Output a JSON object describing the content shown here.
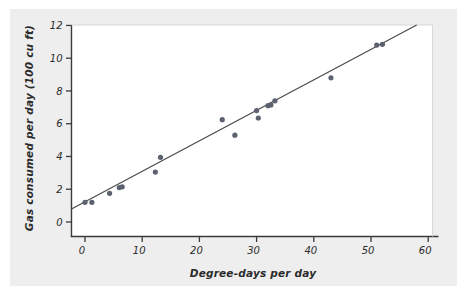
{
  "chart_data": {
    "type": "scatter",
    "title": "",
    "xlabel": "Degree-days per day",
    "ylabel": "Gas consumed per day (100 cu ft)",
    "xlim": [
      -3,
      63
    ],
    "ylim": [
      -0.55,
      12.6
    ],
    "xticks": [
      0,
      10,
      20,
      30,
      40,
      50,
      60
    ],
    "yticks": [
      0,
      2,
      4,
      6,
      8,
      10,
      12
    ],
    "xtick_labels": [
      "0",
      "10",
      "20",
      "30",
      "40",
      "50",
      "60"
    ],
    "ytick_labels": [
      "0",
      "2",
      "4",
      "6",
      "8",
      "10",
      "12"
    ],
    "grid": false,
    "legend": null,
    "marker_color": "#5c6170",
    "line_color": "#4a4a4a",
    "panel_color": "#eeeeee",
    "plot_area_color": "#ffffff",
    "points": [
      {
        "x": 0.0,
        "y": 1.2
      },
      {
        "x": 1.2,
        "y": 1.2
      },
      {
        "x": 4.3,
        "y": 1.75
      },
      {
        "x": 6.0,
        "y": 2.1
      },
      {
        "x": 6.5,
        "y": 2.15
      },
      {
        "x": 12.3,
        "y": 3.05
      },
      {
        "x": 13.2,
        "y": 3.95
      },
      {
        "x": 24.0,
        "y": 6.25
      },
      {
        "x": 26.2,
        "y": 5.3
      },
      {
        "x": 30.0,
        "y": 6.8
      },
      {
        "x": 30.3,
        "y": 6.35
      },
      {
        "x": 32.0,
        "y": 7.1
      },
      {
        "x": 32.5,
        "y": 7.15
      },
      {
        "x": 33.2,
        "y": 7.4
      },
      {
        "x": 43.0,
        "y": 8.8
      },
      {
        "x": 51.0,
        "y": 10.8
      },
      {
        "x": 52.0,
        "y": 10.85
      }
    ],
    "fit_line": {
      "label": "least-squares regression line",
      "x_start": -3.0,
      "y_start": 0.68,
      "x_end": 60.8,
      "y_end": 12.55
    }
  }
}
